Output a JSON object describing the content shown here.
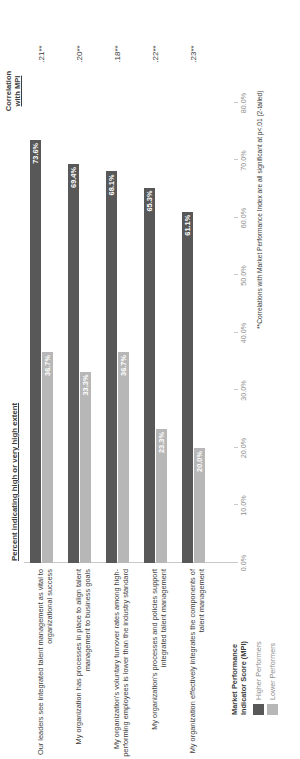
{
  "chart_data": {
    "type": "bar",
    "orientation": "horizontal",
    "title": "Percent indicating high or very high extent",
    "xlabel": "",
    "ylabel": "",
    "xlim": [
      0,
      80
    ],
    "grid": false,
    "legend_position": "bottom-left",
    "categories": [
      "Our leaders see integrated talent management as vital to organizational success",
      "My organization has processes in place to align talent management to business goals",
      "My organization's voluntary turnover rates among high-performing employees is lower than the industry standard",
      "My organization's processes and policies support integrated talent management",
      "My organization effectively integrates the components of talent management"
    ],
    "series": [
      {
        "name": "Higher Performers",
        "color": "#585858",
        "values": [
          73.6,
          69.4,
          68.1,
          65.3,
          61.1
        ],
        "labels": [
          "73.6%",
          "69.4%",
          "68.1%",
          "65.3%",
          "61.1%"
        ]
      },
      {
        "name": "Lower Performers",
        "color": "#b7b7b7",
        "values": [
          36.7,
          33.3,
          36.7,
          23.3,
          20.0
        ],
        "labels": [
          "36.7%",
          "33.3%",
          "36.7%",
          "23.3%",
          "20.0%"
        ]
      }
    ],
    "tick_labels": [
      "0.0%",
      "10.0%",
      "20.0%",
      "30.0%",
      "40.0%",
      "50.0%",
      "60.0%",
      "70.0%",
      "80.0%"
    ],
    "tick_values": [
      0,
      10,
      20,
      30,
      40,
      50,
      60,
      70,
      80
    ],
    "annotations": {
      "correlation_header_line1": "Correlation",
      "correlation_header_line2": "with MPI",
      "correlation_values": [
        ".21**",
        ".20**",
        ".18**",
        ".22**",
        ".23**"
      ]
    },
    "footnote": "**Correlations with Market Performance Index are all significant at  p<.01 (2-tailed)"
  },
  "legend": {
    "title_line1": "Market Performance",
    "title_line2": "Indicator Score (MPI)",
    "items": [
      {
        "label": "Higher Performers",
        "color": "#585858"
      },
      {
        "label": "Lower Performers",
        "color": "#b7b7b7"
      }
    ]
  }
}
